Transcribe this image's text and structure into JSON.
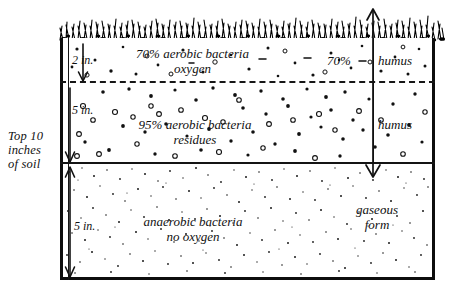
{
  "diagram": {
    "side_label": "Top 10\ninches\nof soil",
    "surface": {
      "icon": "grass-icon",
      "name": "grass surface"
    },
    "depth_markers": [
      {
        "id": "depth-2in",
        "label": "2 in."
      },
      {
        "id": "depth-5in-upper",
        "label": "5 in."
      },
      {
        "id": "depth-5in-lower",
        "label": "5 in."
      }
    ],
    "layers": [
      {
        "id": "layer-aerobic-oxygen",
        "depth": "2 in.",
        "text": "70% aerobic bacteria\noxygen",
        "percent": "70%",
        "right_label": "humus",
        "texture": "sparse-specks"
      },
      {
        "id": "layer-aerobic-residues",
        "depth": "5 in.",
        "text": "95% aerobic bacteria\nresidues",
        "right_label": "humus",
        "texture": "dense-rings"
      },
      {
        "id": "layer-anaerobic",
        "depth": "5 in.",
        "text": "anaerobic bacteria\nno oxygen",
        "right_label": "",
        "texture": "fine-stipple"
      }
    ],
    "gas_flow": {
      "label": "gaseous\nform",
      "direction": "double-headed vertical arrow"
    },
    "colors": {
      "ink": "#111111",
      "paper": "#ffffff"
    }
  }
}
